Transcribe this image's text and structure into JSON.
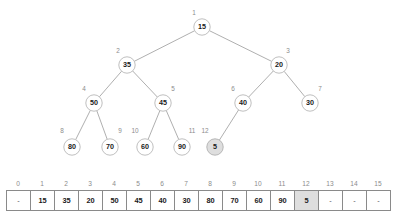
{
  "figure": {
    "colors": {
      "node_fill": "#ffffff",
      "node_stroke": "#b8b8b8",
      "highlight_fill": "#dedede",
      "edge": "#9a9a9a",
      "index_label": "#8c8c8c",
      "value_text": "#1a1a1a",
      "cell_border": "#8a8a8a"
    }
  },
  "tree": {
    "nodes": [
      {
        "index": "1",
        "value": "15",
        "cx": 202,
        "cy": 27,
        "highlight": false,
        "label_dx": -8,
        "label_dy": -12
      },
      {
        "index": "2",
        "value": "35",
        "cx": 127,
        "cy": 65,
        "highlight": false,
        "label_dx": -9,
        "label_dy": -12
      },
      {
        "index": "3",
        "value": "20",
        "cx": 279,
        "cy": 65,
        "highlight": false,
        "label_dx": 9,
        "label_dy": -12
      },
      {
        "index": "4",
        "value": "50",
        "cx": 94,
        "cy": 103,
        "highlight": false,
        "label_dx": -10,
        "label_dy": -12
      },
      {
        "index": "5",
        "value": "45",
        "cx": 163,
        "cy": 103,
        "highlight": false,
        "label_dx": 10,
        "label_dy": -12
      },
      {
        "index": "6",
        "value": "40",
        "cx": 243,
        "cy": 103,
        "highlight": false,
        "label_dx": -10,
        "label_dy": -12
      },
      {
        "index": "7",
        "value": "30",
        "cx": 310,
        "cy": 103,
        "highlight": false,
        "label_dx": 10,
        "label_dy": -12
      },
      {
        "index": "8",
        "value": "80",
        "cx": 72,
        "cy": 147,
        "highlight": false,
        "label_dx": -10,
        "label_dy": -14
      },
      {
        "index": "9",
        "value": "70",
        "cx": 110,
        "cy": 147,
        "highlight": false,
        "label_dx": 10,
        "label_dy": -14
      },
      {
        "index": "10",
        "value": "60",
        "cx": 145,
        "cy": 147,
        "highlight": false,
        "label_dx": -10,
        "label_dy": -14
      },
      {
        "index": "11",
        "value": "90",
        "cx": 182,
        "cy": 147,
        "highlight": false,
        "label_dx": 10,
        "label_dy": -14
      },
      {
        "index": "12",
        "value": "5",
        "cx": 215,
        "cy": 147,
        "highlight": true,
        "label_dx": -10,
        "label_dy": -14
      }
    ],
    "edges": [
      {
        "from": "1",
        "to": "2"
      },
      {
        "from": "1",
        "to": "3"
      },
      {
        "from": "2",
        "to": "4"
      },
      {
        "from": "2",
        "to": "5"
      },
      {
        "from": "3",
        "to": "6"
      },
      {
        "from": "3",
        "to": "7"
      },
      {
        "from": "4",
        "to": "8"
      },
      {
        "from": "4",
        "to": "9"
      },
      {
        "from": "5",
        "to": "10"
      },
      {
        "from": "5",
        "to": "11"
      },
      {
        "from": "6",
        "to": "12"
      }
    ],
    "node_radius": 8.2
  },
  "array": {
    "indices": [
      "0",
      "1",
      "2",
      "3",
      "4",
      "5",
      "6",
      "7",
      "8",
      "9",
      "10",
      "11",
      "12",
      "13",
      "14",
      "15"
    ],
    "values": [
      "-",
      "15",
      "35",
      "20",
      "50",
      "45",
      "40",
      "30",
      "80",
      "70",
      "60",
      "90",
      "5",
      "-",
      "-",
      "-"
    ],
    "highlighted_index": "12",
    "empty_marker": "-"
  }
}
